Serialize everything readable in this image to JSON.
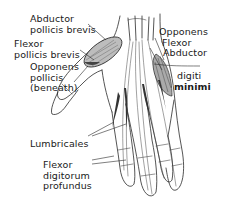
{
  "diagram": {
    "labels": {
      "abductor_pollicis_brevis": [
        "Abductor",
        "pollicis brevis"
      ],
      "flexor_pollicis_brevis": [
        "Flexor",
        "pollicis brevis"
      ],
      "opponens_pollicis": [
        "Opponens",
        "pollicis",
        "(beneath)"
      ],
      "hypothenar_group": [
        "Opponens",
        "Flexor",
        "Abductor"
      ],
      "digiti_minimi": [
        "digiti",
        "minimi"
      ],
      "lumbricales": [
        "Lumbricales"
      ],
      "flexor_digitorum_profundus": [
        "Flexor",
        "digitorum",
        "profundus"
      ]
    },
    "colors": {
      "line": "#2a2a2a",
      "muscle_shade": "#555555",
      "background": "#ffffff"
    }
  }
}
